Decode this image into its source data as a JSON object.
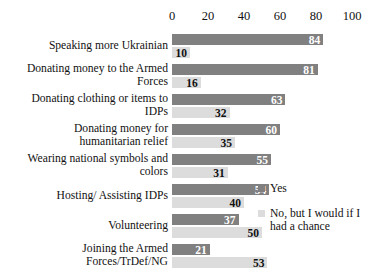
{
  "chart_data": {
    "type": "bar",
    "orientation": "horizontal",
    "title": "",
    "xlabel": "",
    "ylabel": "",
    "xlim": [
      0,
      100
    ],
    "xticks": [
      0,
      20,
      40,
      60,
      80,
      100
    ],
    "grid": false,
    "legend_position": "right",
    "categories": [
      "Speaking more Ukrainian",
      "Donating money to the Armed Forces",
      "Donating clothing or items to IDPs",
      "Donating money for humanitarian relief",
      "Wearing national symbols and colors",
      "Hosting/ Assisting IDPs",
      "Volunteering",
      "Joining the Armed Forces/TrDef/NG"
    ],
    "series": [
      {
        "name": "Yes",
        "color": "#808080",
        "values": [
          84,
          81,
          63,
          60,
          55,
          54,
          37,
          21
        ]
      },
      {
        "name": "No, but I would if I had a chance",
        "color": "#dcdcdc",
        "values": [
          10,
          16,
          32,
          35,
          31,
          40,
          50,
          53
        ]
      }
    ]
  },
  "legend": {
    "items": [
      {
        "label": "Yes",
        "color": "#808080"
      },
      {
        "label": "No, but I would if I had a chance",
        "color": "#dcdcdc"
      }
    ]
  },
  "axis": {
    "tick_labels": [
      "0",
      "20",
      "40",
      "60",
      "80",
      "100"
    ]
  }
}
